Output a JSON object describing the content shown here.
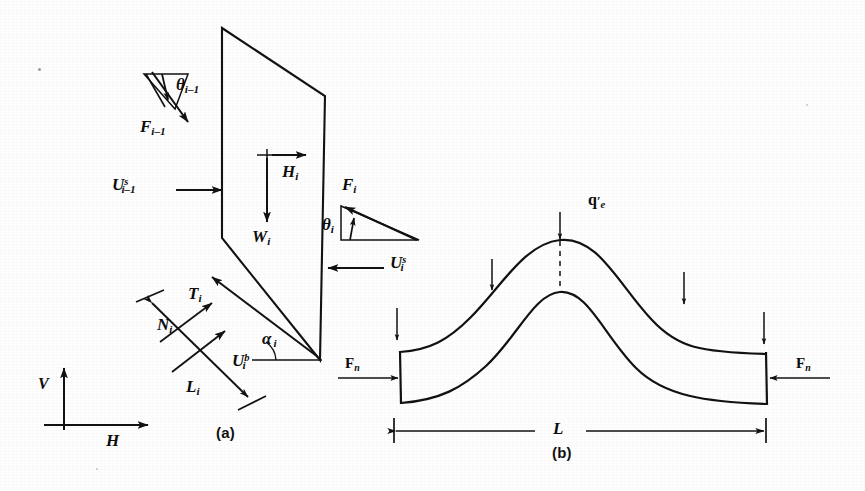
{
  "figure": {
    "ink_color": "#121212",
    "paper_color": "#fefefe"
  },
  "panel_a": {
    "caption": "(a)",
    "labels": {
      "theta_prev": {
        "base": "θ",
        "sub": "i–1"
      },
      "force_prev": {
        "base": "F",
        "sub": "i–1"
      },
      "water_side_prev": {
        "base": "U",
        "sup": "s",
        "sub": "i–1"
      },
      "horizontal_force": {
        "base": "H",
        "sub": "i"
      },
      "weight": {
        "base": "W",
        "sub": "i"
      },
      "force_next": {
        "base": "F",
        "sub": "i"
      },
      "theta_next": {
        "base": "θ",
        "sub": "i"
      },
      "water_side_next": {
        "base": "U",
        "sup": "s",
        "sub": "i"
      },
      "shear_base": {
        "base": "T",
        "sub": "i"
      },
      "normal_base": {
        "base": "N",
        "sub": "i"
      },
      "water_base": {
        "base": "U",
        "sup": "b",
        "sub": "i"
      },
      "alpha": {
        "base": "α",
        "sub": "i"
      },
      "base_length": {
        "base": "L",
        "sub": "i"
      },
      "axis_vertical": {
        "base": "V"
      },
      "axis_horizontal": {
        "base": "H"
      }
    }
  },
  "panel_b": {
    "caption": "(b)",
    "labels": {
      "surcharge": {
        "base": "q",
        "prime": "′",
        "sub": "e"
      },
      "thrust_left": {
        "base": "F",
        "nsub": "n"
      },
      "thrust_right": {
        "base": "F",
        "nsub": "n"
      },
      "span": {
        "base": "L"
      }
    },
    "load_arrow_count": 4
  }
}
